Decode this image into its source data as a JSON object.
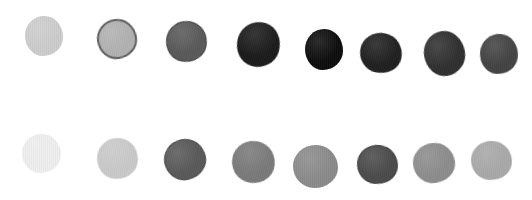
{
  "image": {
    "width": 532,
    "height": 200,
    "background": "#ffffff",
    "description": "Two rows of eight watercolor-style grayscale dots"
  },
  "rows": [
    {
      "name": "top-row",
      "swatches": [
        {
          "cx": 44,
          "cy": 36,
          "w": 38,
          "h": 40,
          "fill": "#cdcdcd",
          "edge": "#c2c2c2",
          "edge_width": 0,
          "rot": 0
        },
        {
          "cx": 117,
          "cy": 39,
          "w": 40,
          "h": 40,
          "fill": "#b2b2b2",
          "edge": "#5e5e5e",
          "edge_width": 2,
          "rot": -8
        },
        {
          "cx": 186,
          "cy": 41,
          "w": 41,
          "h": 41,
          "fill": "#595959",
          "edge": "#3e3e3e",
          "edge_width": 1,
          "rot": 10
        },
        {
          "cx": 258,
          "cy": 44,
          "w": 43,
          "h": 45,
          "fill": "#1a1a1a",
          "edge": "#101010",
          "edge_width": 0,
          "rot": 15
        },
        {
          "cx": 324,
          "cy": 49,
          "w": 38,
          "h": 41,
          "fill": "#0d0d0d",
          "edge": "#050505",
          "edge_width": 0,
          "rot": 0
        },
        {
          "cx": 381,
          "cy": 53,
          "w": 42,
          "h": 40,
          "fill": "#1f1f1f",
          "edge": "#0f0f0f",
          "edge_width": 0,
          "rot": 12
        },
        {
          "cx": 444,
          "cy": 53,
          "w": 41,
          "h": 45,
          "fill": "#2f2f2f",
          "edge": "#222222",
          "edge_width": 0,
          "rot": -10
        },
        {
          "cx": 499,
          "cy": 54,
          "w": 38,
          "h": 40,
          "fill": "#424242",
          "edge": "#333333",
          "edge_width": 0,
          "rot": 5
        }
      ]
    },
    {
      "name": "bottom-row",
      "swatches": [
        {
          "cx": 41,
          "cy": 153,
          "w": 39,
          "h": 39,
          "fill": "#efefef",
          "edge": "#ebebeb",
          "edge_width": 0,
          "rot": 0
        },
        {
          "cx": 117,
          "cy": 158,
          "w": 41,
          "h": 41,
          "fill": "#cacaca",
          "edge": "#dddddd",
          "edge_width": 0,
          "rot": 8
        },
        {
          "cx": 185,
          "cy": 159,
          "w": 42,
          "h": 41,
          "fill": "#595959",
          "edge": "#444444",
          "edge_width": 1,
          "rot": -12
        },
        {
          "cx": 253,
          "cy": 162,
          "w": 43,
          "h": 42,
          "fill": "#7a7a7a",
          "edge": "#6e6e6e",
          "edge_width": 0,
          "rot": 14
        },
        {
          "cx": 315,
          "cy": 166,
          "w": 45,
          "h": 43,
          "fill": "#8b8b8b",
          "edge": "#7f7f7f",
          "edge_width": 0,
          "rot": 0
        },
        {
          "cx": 377,
          "cy": 164,
          "w": 41,
          "h": 39,
          "fill": "#4b4b4b",
          "edge": "#3a3a3a",
          "edge_width": 1,
          "rot": 6
        },
        {
          "cx": 434,
          "cy": 163,
          "w": 42,
          "h": 40,
          "fill": "#8d8d8d",
          "edge": "#7d7d7d",
          "edge_width": 0,
          "rot": -6
        },
        {
          "cx": 491,
          "cy": 160,
          "w": 41,
          "h": 39,
          "fill": "#a9a9a9",
          "edge": "#9d9d9d",
          "edge_width": 0,
          "rot": 4
        }
      ]
    }
  ]
}
